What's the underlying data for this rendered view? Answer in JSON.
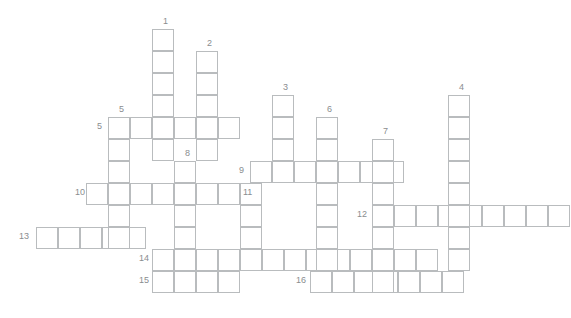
{
  "puzzle": {
    "title": "Crossword puzzle grid",
    "cell_size": 22,
    "grid_color": "#b9bcbe",
    "number_color": "#8a8d8f",
    "background_color": "#ffffff",
    "canvas": {
      "width": 571,
      "height": 318
    },
    "origin": {
      "x": 13,
      "y": 29
    },
    "entries": [
      {
        "number": "1",
        "direction": "down",
        "col": 6,
        "row": 0,
        "length": 6,
        "label_x": 163,
        "label_y": 17
      },
      {
        "number": "2",
        "direction": "down",
        "col": 8,
        "row": 1,
        "length": 5,
        "label_x": 203,
        "label_y": 39
      },
      {
        "number": "3",
        "direction": "down",
        "col": 12,
        "row": 3,
        "length": 4,
        "label_x": 281,
        "label_y": 83
      },
      {
        "number": "4",
        "direction": "down",
        "col": 20,
        "row": 3,
        "length": 8,
        "label_x": 457,
        "label_y": 83
      },
      {
        "number": "5",
        "direction": "down",
        "col": 4,
        "row": 4,
        "length": 6,
        "label_x": 123,
        "label_y": 105
      },
      {
        "number": "5",
        "direction": "across",
        "col": 4,
        "row": 4,
        "length": 6,
        "label_x": 98,
        "label_y": 122
      },
      {
        "number": "6",
        "direction": "down",
        "col": 14,
        "row": 4,
        "length": 7,
        "label_x": 318,
        "label_y": 100
      },
      {
        "number": "7",
        "direction": "down",
        "col": 16,
        "row": 5,
        "length": 8,
        "label_x": 378,
        "label_y": 122
      },
      {
        "number": "8",
        "direction": "down",
        "col": 7,
        "row": 6,
        "length": 8,
        "label_x": 182,
        "label_y": 144
      },
      {
        "number": "9",
        "direction": "across",
        "col": 11,
        "row": 6,
        "length": 7,
        "label_x": 237,
        "label_y": 165
      },
      {
        "number": "10",
        "direction": "across",
        "col": 2,
        "row": 7,
        "length": 8,
        "label_x": 78,
        "label_y": 186
      },
      {
        "number": "11",
        "direction": "down",
        "col": 10,
        "row": 8,
        "length": 4,
        "label_x": 237,
        "label_y": 187
      },
      {
        "number": "12",
        "direction": "across",
        "col": 16,
        "row": 8,
        "length": 9,
        "label_x": 356,
        "label_y": 208
      },
      {
        "number": "13",
        "direction": "across",
        "col": 0,
        "row": 9,
        "length": 5,
        "label_x": 18,
        "label_y": 229
      },
      {
        "number": "14",
        "direction": "across",
        "col": 6,
        "row": 10,
        "length": 13,
        "label_x": 138,
        "label_y": 246
      },
      {
        "number": "15",
        "direction": "across",
        "col": 6,
        "row": 11,
        "length": 4,
        "label_x": 138,
        "label_y": 290
      },
      {
        "number": "16",
        "direction": "across",
        "col": 13,
        "row": 11,
        "length": 7,
        "label_x": 296,
        "label_y": 290
      }
    ],
    "cells": [
      {
        "x": 152,
        "y": 29
      },
      {
        "x": 152,
        "y": 51
      },
      {
        "x": 152,
        "y": 73
      },
      {
        "x": 152,
        "y": 95
      },
      {
        "x": 152,
        "y": 117
      },
      {
        "x": 152,
        "y": 139
      },
      {
        "x": 196,
        "y": 51
      },
      {
        "x": 196,
        "y": 73
      },
      {
        "x": 196,
        "y": 95
      },
      {
        "x": 196,
        "y": 117
      },
      {
        "x": 196,
        "y": 139
      },
      {
        "x": 272,
        "y": 95
      },
      {
        "x": 272,
        "y": 117
      },
      {
        "x": 272,
        "y": 139
      },
      {
        "x": 272,
        "y": 161
      },
      {
        "x": 448,
        "y": 95
      },
      {
        "x": 448,
        "y": 117
      },
      {
        "x": 448,
        "y": 139
      },
      {
        "x": 448,
        "y": 161
      },
      {
        "x": 448,
        "y": 183
      },
      {
        "x": 448,
        "y": 205
      },
      {
        "x": 448,
        "y": 227
      },
      {
        "x": 448,
        "y": 249
      },
      {
        "x": 108,
        "y": 117
      },
      {
        "x": 108,
        "y": 139
      },
      {
        "x": 108,
        "y": 161
      },
      {
        "x": 108,
        "y": 183
      },
      {
        "x": 108,
        "y": 205
      },
      {
        "x": 108,
        "y": 227
      },
      {
        "x": 130,
        "y": 117
      },
      {
        "x": 174,
        "y": 117
      },
      {
        "x": 218,
        "y": 117
      },
      {
        "x": 316,
        "y": 117
      },
      {
        "x": 316,
        "y": 139
      },
      {
        "x": 316,
        "y": 161
      },
      {
        "x": 316,
        "y": 183
      },
      {
        "x": 316,
        "y": 205
      },
      {
        "x": 316,
        "y": 227
      },
      {
        "x": 316,
        "y": 249
      },
      {
        "x": 372,
        "y": 139
      },
      {
        "x": 372,
        "y": 161
      },
      {
        "x": 372,
        "y": 183
      },
      {
        "x": 372,
        "y": 205
      },
      {
        "x": 372,
        "y": 227
      },
      {
        "x": 372,
        "y": 249
      },
      {
        "x": 372,
        "y": 271
      },
      {
        "x": 174,
        "y": 161
      },
      {
        "x": 174,
        "y": 183
      },
      {
        "x": 174,
        "y": 205
      },
      {
        "x": 174,
        "y": 227
      },
      {
        "x": 174,
        "y": 249
      },
      {
        "x": 174,
        "y": 271
      },
      {
        "x": 250,
        "y": 161
      },
      {
        "x": 294,
        "y": 161
      },
      {
        "x": 338,
        "y": 161
      },
      {
        "x": 350,
        "y": 161
      },
      {
        "x": 86,
        "y": 183
      },
      {
        "x": 130,
        "y": 183
      },
      {
        "x": 152,
        "y": 183
      },
      {
        "x": 196,
        "y": 183
      },
      {
        "x": 218,
        "y": 183
      },
      {
        "x": 240,
        "y": 183
      },
      {
        "x": 240,
        "y": 205
      },
      {
        "x": 240,
        "y": 227
      },
      {
        "x": 394,
        "y": 205
      },
      {
        "x": 416,
        "y": 205
      },
      {
        "x": 470,
        "y": 205
      },
      {
        "x": 492,
        "y": 205
      },
      {
        "x": 514,
        "y": 205
      },
      {
        "x": 36,
        "y": 227
      },
      {
        "x": 58,
        "y": 227
      },
      {
        "x": 80,
        "y": 227
      },
      {
        "x": 86,
        "y": 227
      },
      {
        "x": 196,
        "y": 249
      },
      {
        "x": 218,
        "y": 249
      },
      {
        "x": 262,
        "y": 249
      },
      {
        "x": 284,
        "y": 249
      },
      {
        "x": 338,
        "y": 249
      },
      {
        "x": 350,
        "y": 249
      },
      {
        "x": 394,
        "y": 249
      },
      {
        "x": 416,
        "y": 249
      },
      {
        "x": 196,
        "y": 271
      },
      {
        "x": 218,
        "y": 271
      },
      {
        "x": 310,
        "y": 271
      },
      {
        "x": 332,
        "y": 271
      },
      {
        "x": 354,
        "y": 271
      },
      {
        "x": 394,
        "y": 271
      },
      {
        "x": 416,
        "y": 271
      },
      {
        "x": 438,
        "y": 271
      }
    ],
    "rows": [
      {
        "name": "row-5-across",
        "x": 108,
        "y": 117,
        "count": 6,
        "number": "5"
      },
      {
        "name": "row-9-across",
        "x": 250,
        "y": 161,
        "count": 7,
        "number": "9"
      },
      {
        "name": "row-10-across",
        "x": 86,
        "y": 183,
        "count": 8,
        "number": "10"
      },
      {
        "name": "row-12-across",
        "x": 372,
        "y": 205,
        "count": 9,
        "number": "12"
      },
      {
        "name": "row-13-across",
        "x": 36,
        "y": 227,
        "count": 5,
        "number": "13"
      },
      {
        "name": "row-14-across",
        "x": 152,
        "y": 249,
        "count": 13,
        "number": "14"
      },
      {
        "name": "row-15-across",
        "x": 152,
        "y": 271,
        "count": 4,
        "number": "15"
      },
      {
        "name": "row-16-across",
        "x": 310,
        "y": 271,
        "count": 7,
        "number": "16"
      }
    ],
    "cols": [
      {
        "name": "col-1-down",
        "x": 152,
        "y": 29,
        "count": 6,
        "number": "1"
      },
      {
        "name": "col-2-down",
        "x": 196,
        "y": 51,
        "count": 5,
        "number": "2"
      },
      {
        "name": "col-3-down",
        "x": 272,
        "y": 95,
        "count": 4,
        "number": "3"
      },
      {
        "name": "col-4-down",
        "x": 448,
        "y": 95,
        "count": 8,
        "number": "4"
      },
      {
        "name": "col-5-down",
        "x": 108,
        "y": 117,
        "count": 6,
        "number": "5"
      },
      {
        "name": "col-6-down",
        "x": 316,
        "y": 117,
        "count": 7,
        "number": "6"
      },
      {
        "name": "col-7-down",
        "x": 372,
        "y": 139,
        "count": 7,
        "number": "7"
      },
      {
        "name": "col-8-down",
        "x": 174,
        "y": 161,
        "count": 6,
        "number": "8"
      },
      {
        "name": "col-11-down",
        "x": 240,
        "y": 183,
        "count": 3,
        "number": "11"
      }
    ],
    "numbers": [
      {
        "text": "1",
        "x": 163,
        "y": 16
      },
      {
        "text": "2",
        "x": 207,
        "y": 38
      },
      {
        "text": "3",
        "x": 283,
        "y": 82
      },
      {
        "text": "4",
        "x": 459,
        "y": 82
      },
      {
        "text": "5",
        "x": 119,
        "y": 104
      },
      {
        "text": "5",
        "x": 97,
        "y": 121
      },
      {
        "text": "6",
        "x": 327,
        "y": 104
      },
      {
        "text": "7",
        "x": 383,
        "y": 126
      },
      {
        "text": "8",
        "x": 185,
        "y": 148
      },
      {
        "text": "9",
        "x": 239,
        "y": 165
      },
      {
        "text": "10",
        "x": 75,
        "y": 187
      },
      {
        "text": "11",
        "x": 243,
        "y": 187
      },
      {
        "text": "12",
        "x": 357,
        "y": 209
      },
      {
        "text": "13",
        "x": 19,
        "y": 231
      },
      {
        "text": "14",
        "x": 139,
        "y": 253
      },
      {
        "text": "15",
        "x": 139,
        "y": 275
      },
      {
        "text": "16",
        "x": 296,
        "y": 275
      }
    ]
  }
}
